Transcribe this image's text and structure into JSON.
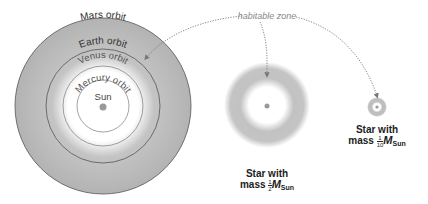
{
  "diagram": {
    "callout": {
      "label": "habitable zone"
    },
    "solar_system": {
      "orbits": [
        {
          "name": "Mars orbit",
          "radius": 88
        },
        {
          "name": "Earth orbit",
          "radius": 57
        },
        {
          "name": "Venus orbit",
          "radius": 40
        },
        {
          "name": "Mercury orbit",
          "radius": 26
        }
      ],
      "star_label": "Sun"
    },
    "star_half": {
      "line1": "Star with",
      "line2": "mass",
      "frac_num": "1",
      "frac_den": "2",
      "mass_symbol": "M",
      "mass_sub": "Sun"
    },
    "star_tenth": {
      "line1": "Star with",
      "line2": "mass",
      "frac_num": "1",
      "frac_den": "10",
      "mass_symbol": "M",
      "mass_sub": "Sun"
    },
    "colors": {
      "zone": "#b5b5b5",
      "orbit_line": "#555555",
      "star": "#999999",
      "callout": "#777777"
    }
  }
}
